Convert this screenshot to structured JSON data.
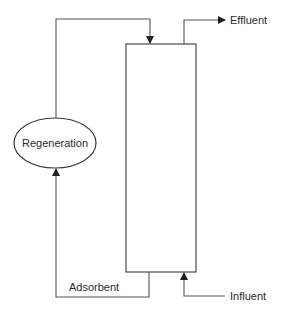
{
  "diagram": {
    "type": "process-flow",
    "colors": {
      "line": "#4a4a4a",
      "text": "#2b2b2b",
      "background": "#ffffff"
    },
    "nodes": {
      "regeneration": {
        "label": "Regeneration",
        "shape": "ellipse"
      },
      "column": {
        "label": "",
        "shape": "rectangle"
      }
    },
    "labels": {
      "effluent": "Effluent",
      "influent": "Influent",
      "adsorbent": "Adsorbent"
    },
    "edges": [
      {
        "from": "regeneration",
        "to": "column",
        "label": "",
        "direction": "down-into-top"
      },
      {
        "from": "column",
        "to": "effluent",
        "label": "Effluent"
      },
      {
        "from": "influent",
        "to": "column",
        "label": "Influent",
        "direction": "up-into-bottom"
      },
      {
        "from": "column",
        "to": "regeneration",
        "label": "Adsorbent"
      }
    ]
  }
}
